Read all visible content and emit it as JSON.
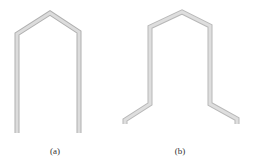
{
  "figure": {
    "panels": [
      {
        "id": "a",
        "caption": "(a)",
        "shape": "inverted-U with peaked top (straight legs)",
        "stroke_color": "#c8c8c8"
      },
      {
        "id": "b",
        "caption": "(b)",
        "shape": "inverted-U with peaked top and outward angled feet",
        "stroke_color": "#c8c8c8"
      }
    ]
  }
}
